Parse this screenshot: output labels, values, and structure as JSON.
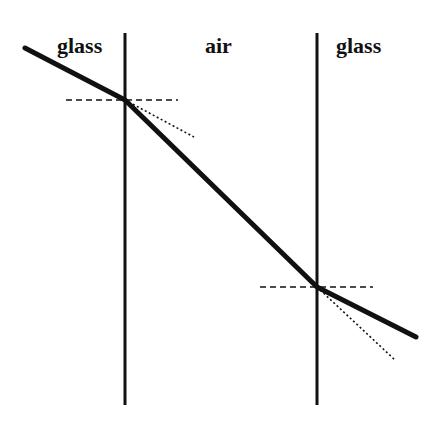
{
  "diagram": {
    "type": "refraction-through-air-gap",
    "regions": [
      {
        "id": "left-glass",
        "label": "glass",
        "x": 57,
        "y": 35
      },
      {
        "id": "air",
        "label": "air",
        "x": 205,
        "y": 35
      },
      {
        "id": "right-glass",
        "label": "glass",
        "x": 336,
        "y": 35
      }
    ],
    "interfaces": [
      {
        "id": "left-interface",
        "x": 125,
        "y1": 33,
        "y2": 405
      },
      {
        "id": "right-interface",
        "x": 317,
        "y1": 33,
        "y2": 405
      }
    ],
    "ray": {
      "points": [
        [
          25,
          48
        ],
        [
          125,
          100
        ],
        [
          317,
          287
        ],
        [
          416,
          337
        ]
      ],
      "stroke": "#111111"
    },
    "normals": [
      {
        "id": "left-normal",
        "x1": 66,
        "x2": 178,
        "y": 100
      },
      {
        "id": "right-normal",
        "x1": 260,
        "x2": 373,
        "y": 287
      }
    ],
    "undeviated_extensions": [
      {
        "id": "left-extension",
        "x1": 125,
        "y1": 100,
        "x2": 194,
        "y2": 137
      },
      {
        "id": "right-extension",
        "x1": 317,
        "y1": 287,
        "x2": 395,
        "y2": 360
      }
    ]
  }
}
